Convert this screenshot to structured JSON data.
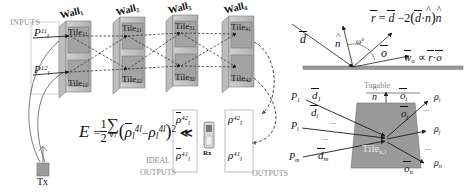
{
  "figure": {
    "title_semantic": "wireless-programmable-environment-tile-model",
    "colors": {
      "wall_light": "#c9c9c9",
      "wall_mid": "#a6a6a6",
      "wall_dark": "#8f8f8f",
      "tile_face": "#9e9e9e",
      "label_grey": "#8a8a8a",
      "ink": "#111111",
      "surface": "#9a9a9a"
    }
  },
  "left_panel": {
    "inputs_label": "INPUTS",
    "input_powers": [
      {
        "base": "P",
        "sub": "l",
        "sup": "11"
      },
      {
        "base": "P",
        "sub": "l",
        "sup": "12"
      }
    ],
    "transmitter_label": "Tx",
    "receiver_label": "Rx",
    "walls": [
      {
        "label": "Wall",
        "sub": "1"
      },
      {
        "label": "Wall",
        "sub": "2"
      },
      {
        "label": "Wall",
        "sub": "3"
      },
      {
        "label": "Wall",
        "sub": "4"
      }
    ],
    "tiles": [
      {
        "label": "Tile",
        "sub": "11"
      },
      {
        "label": "Tile",
        "sub": "21"
      },
      {
        "label": "Tile",
        "sub": "31"
      },
      {
        "label": "Tile",
        "sub": "41"
      },
      {
        "label": "Tile",
        "sub": "12"
      },
      {
        "label": "Tile",
        "sub": "22"
      },
      {
        "label": "Tile",
        "sub": "32"
      },
      {
        "label": "Tile",
        "sub": "42"
      }
    ],
    "error_equation": {
      "lhs": "E",
      "half_num": "1",
      "half_den": "2",
      "sum": "∑",
      "sum_sub": "∀l",
      "term_ideal": {
        "base": "ρ",
        "sub": "l",
        "sup": "4l",
        "barred": true
      },
      "minus": "−",
      "term_actual": {
        "base": "ρ",
        "sub": "l",
        "sup": "4l"
      },
      "power": "2",
      "much_less": "≪"
    },
    "ideal_outputs_label_line1": "IDEAL",
    "ideal_outputs_label_line2": "OUTPUTS",
    "outputs_label": "OUTPUTS",
    "ideal_output_values": [
      {
        "base": "ρ",
        "sub": "l",
        "sup": "42",
        "barred": true
      },
      {
        "base": "ρ",
        "sub": "l",
        "sup": "41",
        "barred": true
      }
    ],
    "output_values": [
      {
        "base": "ρ",
        "sub": "l",
        "sup": "42"
      },
      {
        "base": "ρ",
        "sub": "l",
        "sup": "41"
      }
    ]
  },
  "top_right_panel": {
    "incident_vector": "d",
    "normal_vector": "n",
    "reflected_vector": "r",
    "outgoing_vector": "o",
    "angle_label": "ω°",
    "reflection_equation": {
      "lhs": "r",
      "eq": "=",
      "d": "d",
      "minus": "−",
      "two": "2",
      "open": "(",
      "dot": "·",
      "n": "n",
      "close": ")"
    },
    "weight_equation": {
      "w": "w",
      "w_sub": "o",
      "prop": "∝",
      "r": "r",
      "dot": "·",
      "o": "o"
    }
  },
  "bottom_right_panel": {
    "tunable_label": "Tunable",
    "normal_vector": "n",
    "tile_label": "Tile",
    "tile_sub": "k,l",
    "inputs": [
      {
        "power": "P",
        "power_sub": "1",
        "dir": "d",
        "dir_sub": "1"
      },
      {
        "power": "P",
        "power_sub": "i",
        "dir": "d",
        "dir_sub": "i"
      },
      {
        "power": "P",
        "power_sub": "m",
        "dir": "d",
        "dir_sub": "m"
      }
    ],
    "outputs": [
      {
        "dir": "o",
        "dir_sub": "i",
        "rho": "ρ",
        "rho_sub": "i"
      },
      {
        "dir": "o",
        "dir_sub": "j",
        "rho": "ρ",
        "rho_sub": "j"
      },
      {
        "dir": "o",
        "dir_sub": "n",
        "rho": "ρ",
        "rho_sub": "n"
      }
    ],
    "ellipsis": "..."
  }
}
